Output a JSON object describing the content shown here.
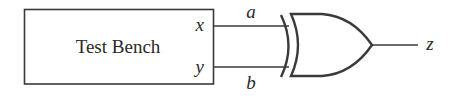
{
  "diagram": {
    "type": "logic-circuit",
    "test_bench": {
      "label": "Test Bench",
      "ports": [
        {
          "name": "x"
        },
        {
          "name": "y"
        }
      ]
    },
    "wires": [
      {
        "from": "x",
        "to": "a",
        "label": "a"
      },
      {
        "from": "y",
        "to": "b",
        "label": "b"
      }
    ],
    "gate": {
      "type": "XOR",
      "inputs": [
        "a",
        "b"
      ],
      "output": "z"
    },
    "output_label": "z",
    "colors": {
      "line": "#3a3a3a",
      "text": "#2a2a2a",
      "background": "#ffffff"
    }
  }
}
